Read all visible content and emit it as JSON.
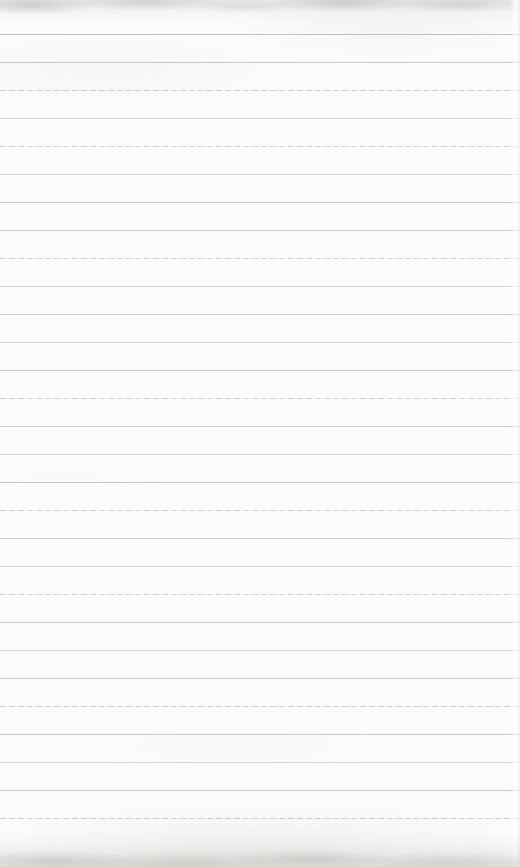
{
  "page": {
    "width_px": 520,
    "height_px": 867,
    "background_color": "#fcfcfa",
    "edge_texture_color": "#a8a8a5"
  },
  "ruling": {
    "line_color": "#9c9c9c",
    "first_line_y": 34,
    "line_spacing_px": 28,
    "line_count": 29,
    "lines": [
      {
        "y": 34,
        "style": "solid",
        "opacity": 0.6
      },
      {
        "y": 62,
        "style": "solid",
        "opacity": 0.55
      },
      {
        "y": 90,
        "style": "dashed",
        "opacity": 0.45
      },
      {
        "y": 118,
        "style": "faint",
        "opacity": 0.38
      },
      {
        "y": 146,
        "style": "dashed",
        "opacity": 0.42
      },
      {
        "y": 174,
        "style": "faint",
        "opacity": 0.38
      },
      {
        "y": 202,
        "style": "solid",
        "opacity": 0.55
      },
      {
        "y": 230,
        "style": "solid",
        "opacity": 0.5
      },
      {
        "y": 258,
        "style": "dashed",
        "opacity": 0.42
      },
      {
        "y": 286,
        "style": "faint",
        "opacity": 0.36
      },
      {
        "y": 314,
        "style": "solid",
        "opacity": 0.52
      },
      {
        "y": 342,
        "style": "faint",
        "opacity": 0.38
      },
      {
        "y": 370,
        "style": "solid",
        "opacity": 0.55
      },
      {
        "y": 398,
        "style": "dashed",
        "opacity": 0.42
      },
      {
        "y": 426,
        "style": "solid",
        "opacity": 0.52
      },
      {
        "y": 454,
        "style": "faint",
        "opacity": 0.38
      },
      {
        "y": 482,
        "style": "solid",
        "opacity": 0.55
      },
      {
        "y": 510,
        "style": "dashed",
        "opacity": 0.42
      },
      {
        "y": 538,
        "style": "solid",
        "opacity": 0.5
      },
      {
        "y": 566,
        "style": "faint",
        "opacity": 0.38
      },
      {
        "y": 594,
        "style": "dashed",
        "opacity": 0.42
      },
      {
        "y": 622,
        "style": "solid",
        "opacity": 0.55
      },
      {
        "y": 650,
        "style": "faint",
        "opacity": 0.4
      },
      {
        "y": 678,
        "style": "solid",
        "opacity": 0.55
      },
      {
        "y": 706,
        "style": "dashed",
        "opacity": 0.45
      },
      {
        "y": 734,
        "style": "solid",
        "opacity": 0.52
      },
      {
        "y": 762,
        "style": "faint",
        "opacity": 0.42
      },
      {
        "y": 790,
        "style": "solid",
        "opacity": 0.55
      },
      {
        "y": 818,
        "style": "dashed",
        "opacity": 0.45
      }
    ]
  }
}
